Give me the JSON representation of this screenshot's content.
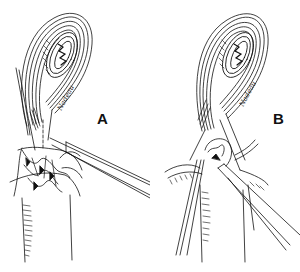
{
  "figure": {
    "background_color": "#ffffff",
    "ink_color": "#111111",
    "panels": [
      {
        "label": "A",
        "signature": "Nadeau",
        "content": "Looped bowel segment with mesenteric vessels fanning out at the base; a single long instrument enters from the right; dashed line marks incision"
      },
      {
        "label": "B",
        "signature": "Nadeau",
        "content": "Looped bowel segment with two clamps/instruments at the base, vessels retracted to both sides"
      }
    ]
  }
}
